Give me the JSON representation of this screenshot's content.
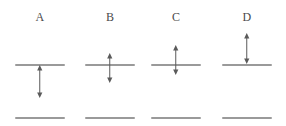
{
  "figure": {
    "width": 286,
    "height": 126,
    "background_color": "#ffffff",
    "label_color": "#4a4a4a",
    "line_color": "#9a9a9a",
    "arrow_color": "#5a5a5a",
    "line_width_px": 50,
    "line_thickness_px": 2,
    "upper_line_y": 65,
    "lower_line_y": 118,
    "panels": [
      {
        "id": "panel-a",
        "label": "A",
        "center_x": 40,
        "arrow": {
          "x": 40,
          "y_top": 65,
          "y_bottom": 98,
          "heads": "both",
          "position": "below-upper-line"
        }
      },
      {
        "id": "panel-b",
        "label": "B",
        "center_x": 110,
        "arrow": {
          "x": 110,
          "y_top": 53,
          "y_bottom": 83,
          "heads": "both",
          "position": "crossing-upper-line-mostly-below"
        }
      },
      {
        "id": "panel-c",
        "label": "C",
        "center_x": 176,
        "arrow": {
          "x": 176,
          "y_top": 45,
          "y_bottom": 75,
          "heads": "both",
          "position": "crossing-upper-line-mostly-above"
        }
      },
      {
        "id": "panel-d",
        "label": "D",
        "center_x": 247,
        "arrow": {
          "x": 247,
          "y_top": 33,
          "y_bottom": 64,
          "heads": "both",
          "position": "above-upper-line"
        }
      }
    ]
  }
}
